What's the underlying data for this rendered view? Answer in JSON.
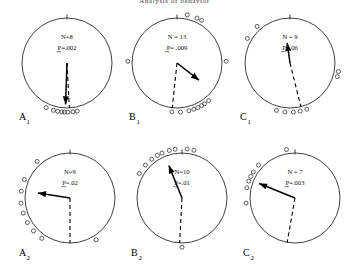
{
  "figure": {
    "title": "Analysis of behavior",
    "panel_count": 6
  },
  "chart_data": {
    "type": "scatter",
    "title": "Analysis of behavior",
    "subtitle": "",
    "xlabel": "",
    "ylabel": "",
    "grid": false,
    "legend": null,
    "note": "Six circular (polar) orientation diagrams. Each panel shows individual bearings as open circles plotted just outside the circle perimeter, a solid mean-vector arrow from the circle centre, a dashed reference/home direction line, and sample size N with Rayleigh probability P.",
    "panels": [
      {
        "id": "A1",
        "label": "A",
        "sub": "1",
        "n_label": "N=8",
        "p_label": "P=.002",
        "n": 8,
        "p": 0.002,
        "mean_vector_deg": 182,
        "mean_vector_length": 0.92,
        "dashed_line_deg": 177,
        "bearings_deg": [
          168,
          173,
          179,
          183,
          186,
          191,
          196,
          205
        ]
      },
      {
        "id": "B1",
        "label": "B",
        "sub": "1",
        "n_label": "N = 13",
        "p_label": "P= .009",
        "n": 13,
        "p": 0.009,
        "mean_vector_deg": 128,
        "mean_vector_length": 0.62,
        "dashed_line_deg": 186,
        "bearings_deg": [
          12,
          24,
          30,
          88,
          140,
          146,
          150,
          155,
          160,
          166,
          176,
          186,
          272
        ]
      },
      {
        "id": "C1",
        "label": "C",
        "sub": "1",
        "n_label": "N = 9",
        "p_label": "P=.06",
        "n": 9,
        "p": 0.06,
        "mean_vector_deg": 352,
        "mean_vector_length": 0.45,
        "dashed_line_deg": 166,
        "bearings_deg": [
          100,
          106,
          160,
          168,
          176,
          186,
          196,
          300,
          318
        ]
      },
      {
        "id": "A2",
        "label": "A",
        "sub": "2",
        "n_label": "N=9",
        "p_label": "P=.02",
        "n": 9,
        "p": 0.02,
        "mean_vector_deg": 279,
        "mean_vector_length": 0.72,
        "dashed_line_deg": 180,
        "bearings_deg": [
          215,
          228,
          240,
          252,
          264,
          278,
          292,
          318,
          148
        ]
      },
      {
        "id": "B2",
        "label": "B",
        "sub": "2",
        "n_label": "N=10",
        "p_label": "P=.01",
        "n": 10,
        "p": 0.01,
        "mean_vector_deg": 338,
        "mean_vector_length": 0.78,
        "dashed_line_deg": 183,
        "bearings_deg": [
          300,
          312,
          322,
          330,
          336,
          345,
          352,
          6,
          14,
          180
        ]
      },
      {
        "id": "C2",
        "label": "C",
        "sub": "2",
        "n_label": "N = 7",
        "p_label": "P=.003",
        "n": 7,
        "p": 0.003,
        "mean_vector_deg": 292,
        "mean_vector_length": 0.86,
        "dashed_line_deg": 190,
        "bearings_deg": [
          282,
          290,
          296,
          302,
          312,
          264,
          350
        ]
      }
    ]
  }
}
